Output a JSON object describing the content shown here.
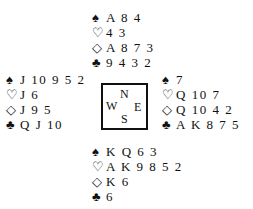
{
  "diagram": {
    "type": "bridge-deal",
    "compass": {
      "north": "N",
      "south": "S",
      "east": "E",
      "west": "W"
    },
    "suit_symbols": {
      "spades": "♠",
      "hearts": "♡",
      "diamonds": "◇",
      "clubs": "♣"
    },
    "hands": {
      "north": {
        "spades": "A 8 4",
        "hearts": "4 3",
        "diamonds": "A 8 7 3",
        "clubs": "9 4 3 2"
      },
      "west": {
        "spades": "J 10 9 5 2",
        "hearts": "J 6",
        "diamonds": "J 9 5",
        "clubs": "Q J 10"
      },
      "east": {
        "spades": "7",
        "hearts": "Q 10 7",
        "diamonds": "Q 10 4 2",
        "clubs": "A K 8 7 5"
      },
      "south": {
        "spades": "K Q 6 3",
        "hearts": "A K 9 8 5 2",
        "diamonds": "K 6",
        "clubs": "6"
      }
    }
  }
}
